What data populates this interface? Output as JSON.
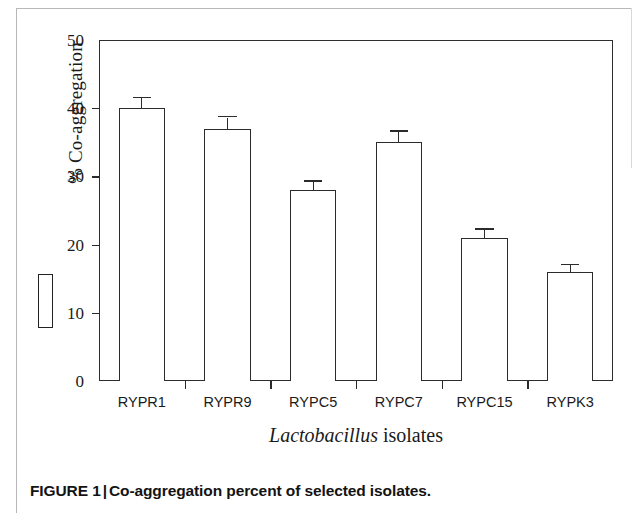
{
  "figure": {
    "caption_label": "FIGURE 1",
    "caption_separator": "|",
    "caption_text": "Co-aggregation percent of selected isolates.",
    "frame_color": "#2e2e2e",
    "bar_outline_color": "#2b2b2b",
    "bar_fill_color": "#ffffff",
    "background_color": "#ffffff"
  },
  "axes": {
    "y_title": "% Co-aggregation",
    "x_title_genus": "Lactobacillus",
    "x_title_rest": " isolates",
    "y_ticks": [
      "0",
      "10",
      "20",
      "30",
      "40",
      "50"
    ]
  },
  "legend": {
    "swatch_name": "co-aggregation-bar-key"
  },
  "chart_data": {
    "type": "bar",
    "title": "Co-aggregation percent of selected isolates",
    "xlabel": "Lactobacillus isolates",
    "ylabel": "% Co-aggregation",
    "ylim": [
      0,
      50
    ],
    "ytick_step": 10,
    "grid": false,
    "legend_position": "left-outside",
    "bar_style": "white fill, black outline",
    "error_bar_style": "upper cap only (T-shaped)",
    "categories": [
      "RYPR1",
      "RYPR9",
      "RYPC5",
      "RYPC7",
      "RYPC15",
      "RYPK3"
    ],
    "values": [
      40,
      37,
      28,
      35,
      21,
      16
    ],
    "errors": [
      1.0,
      1.2,
      0.8,
      1.1,
      0.7,
      0.5
    ],
    "series": [
      {
        "name": "% Co-aggregation",
        "values": [
          40,
          37,
          28,
          35,
          21,
          16
        ],
        "errors": [
          1.0,
          1.2,
          0.8,
          1.1,
          0.7,
          0.5
        ]
      }
    ]
  }
}
